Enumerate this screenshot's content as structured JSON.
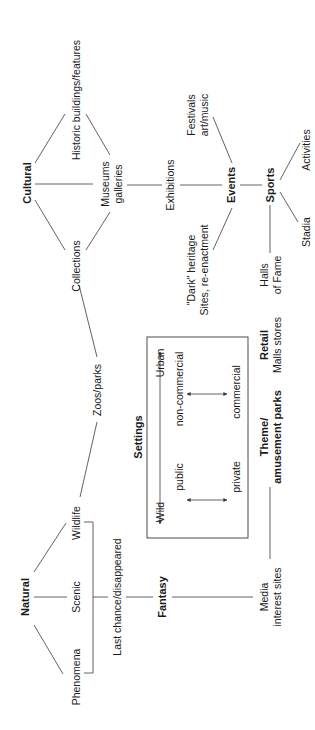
{
  "diagram": {
    "orientation": "rotated-90-ccw",
    "nodes": {
      "cultural": "Cultural",
      "historic": "Historic buildings/features",
      "museums_l1": "Museums",
      "museums_l2": "galleries",
      "collections": "Collections",
      "exhibitions": "Exhibitions",
      "festivals_l1": "Festivals",
      "festivals_l2": "art/music",
      "events": "Events",
      "dark_l1": "\"Dark\" heritage",
      "dark_l2": "Sites, re-enactment",
      "sports": "Sports",
      "activities": "Activities",
      "stadia": "Stadia",
      "halls_l1": "Halls",
      "halls_l2": "of Fame",
      "zoos": "Zoos/parks",
      "retail_l1": "Retail",
      "retail_l2": "Malls stores",
      "theme_l1": "Theme/",
      "theme_l2": "amusement parks",
      "natural": "Natural",
      "phenomena": "Phenomena",
      "scenic": "Scenic",
      "wildlife": "Wildlife",
      "last_chance": "Last chance/disappeared",
      "fantasy": "Fantasy",
      "media_l1": "Media",
      "media_l2": "interest sites"
    },
    "settings": {
      "title": "Settings",
      "wild": "Wild",
      "urban": "Urban",
      "public": "public",
      "private": "private",
      "non_commercial": "non-commercial",
      "commercial": "commercial"
    },
    "edges": [
      [
        "Cultural",
        "Historic buildings/features"
      ],
      [
        "Cultural",
        "Museums galleries"
      ],
      [
        "Cultural",
        "Collections"
      ],
      [
        "Historic buildings/features",
        "Museums galleries"
      ],
      [
        "Collections",
        "Museums galleries"
      ],
      [
        "Museums galleries",
        "Exhibitions"
      ],
      [
        "Exhibitions",
        "Events"
      ],
      [
        "Festivals art/music",
        "Events"
      ],
      [
        "\"Dark\" heritage Sites, re-enactment",
        "Events"
      ],
      [
        "Events",
        "Sports"
      ],
      [
        "Sports",
        "Activities"
      ],
      [
        "Sports",
        "Stadia"
      ],
      [
        "Sports",
        "Halls of Fame"
      ],
      [
        "Collections",
        "Zoos/parks"
      ],
      [
        "Zoos/parks",
        "Wildlife"
      ],
      [
        "Natural",
        "Phenomena"
      ],
      [
        "Natural",
        "Scenic"
      ],
      [
        "Natural",
        "Wildlife"
      ],
      [
        "Phenomena/Scenic/Wildlife",
        "Last chance/disappeared"
      ],
      [
        "Last chance/disappeared",
        "Fantasy"
      ],
      [
        "Fantasy",
        "Media interest sites"
      ],
      [
        "Media interest sites",
        "Theme/amusement parks"
      ]
    ]
  }
}
